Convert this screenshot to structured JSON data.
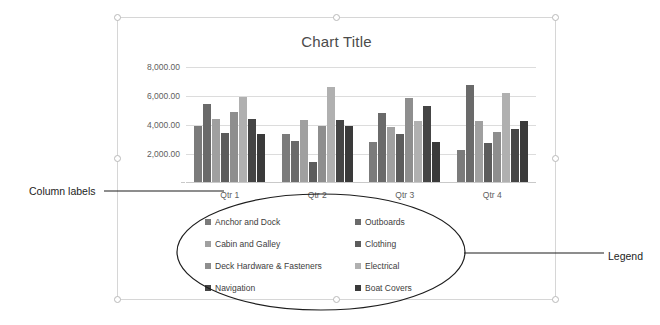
{
  "slide": {
    "chart_title": "Chart Title"
  },
  "annotations": [
    {
      "name": "column-labels",
      "text": "Column labels"
    },
    {
      "name": "legend",
      "text": "Legend"
    }
  ],
  "axis": {
    "y_ticks": [
      "8,000.00",
      "6,000.00",
      "4,000.00",
      "2,000.00"
    ],
    "x_ticks": [
      "Qtr 1",
      "Qtr 2",
      "Qtr 3",
      "Qtr 4"
    ]
  },
  "legend": {
    "items": [
      {
        "label": "Anchor and Dock",
        "color": "#7b7b7b"
      },
      {
        "label": "Outboards",
        "color": "#6a6a6a"
      },
      {
        "label": "Cabin and Galley",
        "color": "#a0a0a0"
      },
      {
        "label": "Clothing",
        "color": "#5c5c5c"
      },
      {
        "label": "Deck Hardware & Fasteners",
        "color": "#8e8e8e"
      },
      {
        "label": "Electrical",
        "color": "#b0b0b0"
      },
      {
        "label": "Navigation",
        "color": "#454545"
      },
      {
        "label": "Boat Covers",
        "color": "#3a3a3a"
      }
    ]
  },
  "chart_data": {
    "type": "bar",
    "title": "Chart Title",
    "xlabel": "",
    "ylabel": "",
    "ylim": [
      0,
      8000
    ],
    "ytick_step": 2000,
    "grid": true,
    "legend_position": "bottom",
    "categories": [
      "Qtr 1",
      "Qtr 2",
      "Qtr 3",
      "Qtr 4"
    ],
    "series": [
      {
        "name": "Anchor and Dock",
        "color": "#7b7b7b",
        "values": [
          3950,
          3400,
          2850,
          2300
        ]
      },
      {
        "name": "Outboards",
        "color": "#6a6a6a",
        "values": [
          5450,
          2900,
          4800,
          6750
        ]
      },
      {
        "name": "Cabin and Galley",
        "color": "#a0a0a0",
        "values": [
          4400,
          4350,
          3850,
          4250
        ]
      },
      {
        "name": "Clothing",
        "color": "#5c5c5c",
        "values": [
          3450,
          1450,
          3350,
          2750
        ]
      },
      {
        "name": "Deck Hardware & Fasteners",
        "color": "#8e8e8e",
        "values": [
          4900,
          3900,
          5850,
          3550
        ]
      },
      {
        "name": "Electrical",
        "color": "#b0b0b0",
        "values": [
          5900,
          6650,
          4300,
          6200
        ]
      },
      {
        "name": "Navigation",
        "color": "#454545",
        "values": [
          4400,
          4350,
          5300,
          3750
        ]
      },
      {
        "name": "Boat Covers",
        "color": "#3a3a3a",
        "values": [
          3400,
          3900,
          2800,
          4250
        ]
      }
    ]
  }
}
